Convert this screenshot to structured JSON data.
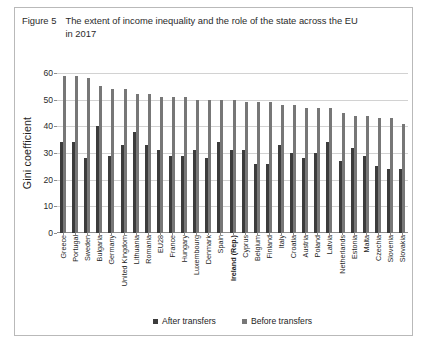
{
  "figure": {
    "label": "Figure 5",
    "title": "The extent of income inequality and the role of the state across the EU in 2017"
  },
  "legend": {
    "items": [
      {
        "label": "After transfers",
        "color": "#3c3c3c"
      },
      {
        "label": "Before transfers",
        "color": "#777777"
      }
    ]
  },
  "axis": {
    "y_label": "Gini coefficient",
    "y_ticks": [
      "0",
      "10",
      "20",
      "30",
      "40",
      "50",
      "60"
    ]
  },
  "chart_data": {
    "type": "bar",
    "title": "The extent of income inequality and the role of the state across the EU in 2017",
    "xlabel": "",
    "ylabel": "Gini coefficient",
    "ylim": [
      0,
      60
    ],
    "ytick_step": 10,
    "grid": true,
    "legend_position": "bottom",
    "highlight_category": "Ireland (Rep.)",
    "categories": [
      "Greece",
      "Portugal",
      "Sweden",
      "Bulgaria",
      "Germany",
      "United Kingdom",
      "Lithuania",
      "Romania",
      "EU28",
      "France",
      "Hungary",
      "Luxembourg",
      "Denmark",
      "Spain",
      "Ireland (Rep.)",
      "Cyprus",
      "Belgium",
      "Finland",
      "Italy",
      "Croatia",
      "Austria",
      "Poland",
      "Latvia",
      "Netherlands",
      "Estonia",
      "Malta",
      "Czechia",
      "Slovenia",
      "Slovakia"
    ],
    "series": [
      {
        "name": "After transfers",
        "color": "#3c3c3c",
        "values": [
          34,
          34,
          28,
          40,
          29,
          33,
          38,
          33,
          31,
          29,
          29,
          31,
          28,
          34,
          31,
          31,
          26,
          26,
          33,
          30,
          28,
          30,
          34,
          27,
          32,
          29,
          25,
          24,
          24
        ]
      },
      {
        "name": "Before transfers",
        "color": "#777777",
        "values": [
          59,
          59,
          58,
          55,
          54,
          54,
          52,
          52,
          51,
          51,
          51,
          50,
          50,
          50,
          50,
          49,
          49,
          49,
          48,
          48,
          47,
          47,
          47,
          45,
          44,
          44,
          43,
          43,
          41
        ]
      }
    ]
  }
}
